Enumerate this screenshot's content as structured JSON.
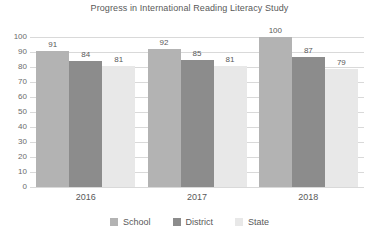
{
  "chart_data": {
    "type": "bar",
    "title": "Progress in International Reading Literacy Study",
    "xlabel": "",
    "ylabel": "",
    "ylim": [
      0,
      100
    ],
    "ytick_step": 10,
    "yticks": [
      "100",
      "90",
      "80",
      "70",
      "60",
      "50",
      "40",
      "30",
      "20",
      "10",
      "0"
    ],
    "grid": true,
    "legend_position": "bottom",
    "categories": [
      "2016",
      "2017",
      "2018"
    ],
    "series": [
      {
        "name": "School",
        "color": "#b3b3b3",
        "values": [
          91,
          84,
          81
        ]
      },
      {
        "name": "District",
        "color": "#8c8c8c",
        "values": [
          92,
          85,
          81
        ]
      },
      {
        "name": "State",
        "color": "#e8e8e8",
        "values": [
          100,
          87,
          79
        ]
      }
    ],
    "groups": [
      {
        "category": "2016",
        "bars": [
          {
            "series": "School",
            "value": 91,
            "label": "91",
            "color": "#b3b3b3"
          },
          {
            "series": "District",
            "value": 84,
            "label": "84",
            "color": "#8c8c8c"
          },
          {
            "series": "State",
            "value": 81,
            "label": "81",
            "color": "#e8e8e8"
          }
        ]
      },
      {
        "category": "2017",
        "bars": [
          {
            "series": "School",
            "value": 92,
            "label": "92",
            "color": "#b3b3b3"
          },
          {
            "series": "District",
            "value": 85,
            "label": "85",
            "color": "#8c8c8c"
          },
          {
            "series": "State",
            "value": 81,
            "label": "81",
            "color": "#e8e8e8"
          }
        ]
      },
      {
        "category": "2018",
        "bars": [
          {
            "series": "School",
            "value": 100,
            "label": "100",
            "color": "#b3b3b3"
          },
          {
            "series": "District",
            "value": 87,
            "label": "87",
            "color": "#8c8c8c"
          },
          {
            "series": "State",
            "value": 79,
            "label": "79",
            "color": "#e8e8e8"
          }
        ]
      }
    ],
    "legend": [
      {
        "label": "School",
        "color": "#b3b3b3"
      },
      {
        "label": "District",
        "color": "#8c8c8c"
      },
      {
        "label": "State",
        "color": "#e8e8e8"
      }
    ]
  },
  "colors": {
    "background": "#ffffff",
    "text": "#595959",
    "gridline": "#d9d9d9",
    "axis": "#bfbfbf"
  }
}
